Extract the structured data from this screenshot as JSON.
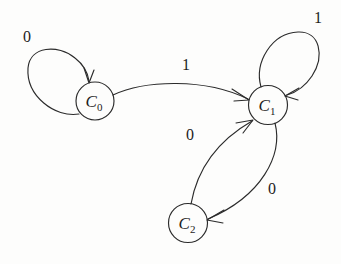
{
  "figure": {
    "type": "state-transition-diagram",
    "background_color": "#fdfdfc",
    "ink_color": "#2b2b2b",
    "width": 341,
    "height": 264
  },
  "chart_data": {
    "type": "diagram",
    "title": "",
    "nodes": [
      {
        "id": "C0",
        "label": "C",
        "subscript": "0",
        "x": 95,
        "y": 101,
        "r": 19
      },
      {
        "id": "C1",
        "label": "C",
        "subscript": "1",
        "x": 268,
        "y": 105,
        "r": 19.5
      },
      {
        "id": "C2",
        "label": "C",
        "subscript": "2",
        "x": 188,
        "y": 223,
        "r": 19.5
      }
    ],
    "edges": [
      {
        "from": "C0",
        "to": "C0",
        "label": "0",
        "label_x": 27,
        "label_y": 38,
        "kind": "self-loop"
      },
      {
        "from": "C0",
        "to": "C1",
        "label": "1",
        "label_x": 186,
        "label_y": 66,
        "kind": "arc"
      },
      {
        "from": "C1",
        "to": "C1",
        "label": "1",
        "label_x": 318,
        "label_y": 19,
        "kind": "self-loop"
      },
      {
        "from": "C2",
        "to": "C1",
        "label": "0",
        "label_x": 190,
        "label_y": 136,
        "kind": "arc"
      },
      {
        "from": "C1",
        "to": "C2",
        "label": "0",
        "label_x": 272,
        "label_y": 190,
        "kind": "arc"
      }
    ]
  }
}
